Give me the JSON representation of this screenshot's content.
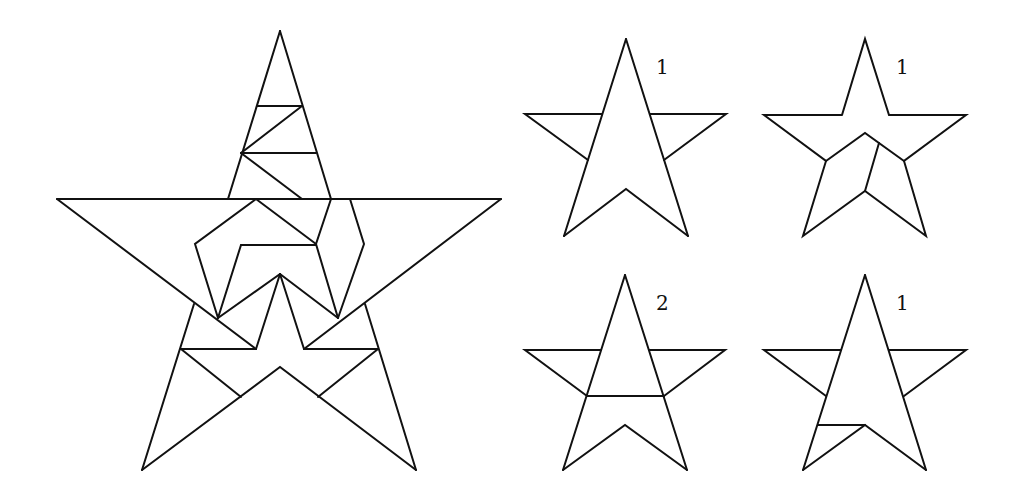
{
  "figure": {
    "stroke_color": "#111111",
    "background": "#ffffff"
  },
  "main_star": {
    "name": "large dissected star",
    "outline_points": "280,31 57,199 501,199 142,470 280,367 416,470"
  },
  "small_stars": [
    {
      "id": "top-left",
      "label": "1"
    },
    {
      "id": "top-right",
      "label": "1"
    },
    {
      "id": "bottom-left",
      "label": "2"
    },
    {
      "id": "bottom-right",
      "label": "1"
    }
  ]
}
